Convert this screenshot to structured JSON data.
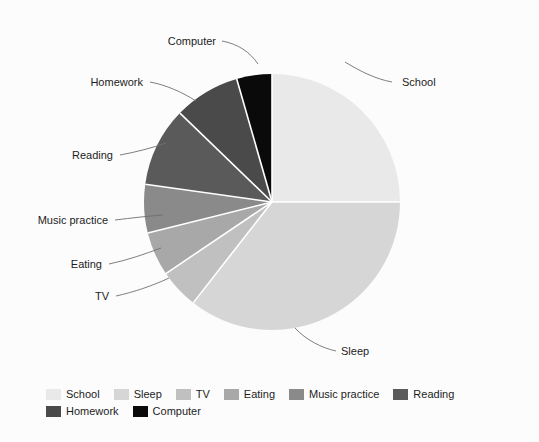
{
  "chart_data": {
    "type": "pie",
    "title": "",
    "legend_position": "bottom",
    "categories": [
      "School",
      "Sleep",
      "TV",
      "Eating",
      "Music practice",
      "Reading",
      "Homework",
      "Computer"
    ],
    "values": [
      90,
      128,
      18,
      20,
      22,
      36,
      30,
      16
    ],
    "unit": "degrees of arc",
    "slices": [
      {
        "label": "School",
        "color": "#e9e9e9",
        "start_angle": 0,
        "sweep": 90,
        "label_x": 402,
        "label_y": 86,
        "anchor": "start",
        "leader": "M 392 82 C 375 79, 358 70, 345 62"
      },
      {
        "label": "Sleep",
        "color": "#d6d6d6",
        "start_angle": 90,
        "sweep": 128,
        "label_x": 341,
        "label_y": 355,
        "anchor": "start",
        "leader": "M 336 351 C 322 348, 306 340, 295 328"
      },
      {
        "label": "TV",
        "color": "#c0c0c0",
        "start_angle": 218,
        "sweep": 18,
        "label_x": 109,
        "label_y": 300,
        "anchor": "end",
        "leader": "M 116 296 C 134 292, 152 286, 169 278"
      },
      {
        "label": "Eating",
        "color": "#a8a8a8",
        "start_angle": 236,
        "sweep": 20,
        "label_x": 102,
        "label_y": 268,
        "anchor": "end",
        "leader": "M 109 264 C 128 260, 145 254, 161 248"
      },
      {
        "label": "Music practice",
        "color": "#8a8a8a",
        "start_angle": 256,
        "sweep": 22,
        "label_x": 108,
        "label_y": 224,
        "anchor": "end",
        "leader": "M 115 220 C 132 218, 148 216, 163 215"
      },
      {
        "label": "Reading",
        "color": "#5a5a5a",
        "start_angle": 278,
        "sweep": 36,
        "label_x": 113,
        "label_y": 159,
        "anchor": "end",
        "leader": "M 120 155 C 136 152, 152 148, 166 143"
      },
      {
        "label": "Homework",
        "color": "#4a4a4a",
        "start_angle": 314,
        "sweep": 30,
        "label_x": 143,
        "label_y": 86,
        "anchor": "end",
        "leader": "M 150 82 C 166 85, 182 92, 196 101"
      },
      {
        "label": "Computer",
        "color": "#0a0a0a",
        "start_angle": 344,
        "sweep": 16,
        "label_x": 216,
        "label_y": 45,
        "anchor": "end",
        "leader": "M 222 41 C 238 44, 250 52, 258 64"
      }
    ],
    "geometry": {
      "cx": 272,
      "cy": 202,
      "r": 128
    }
  },
  "legend": {
    "items": [
      {
        "label": "School",
        "color": "#e9e9e9"
      },
      {
        "label": "Sleep",
        "color": "#d6d6d6"
      },
      {
        "label": "TV",
        "color": "#c0c0c0"
      },
      {
        "label": "Eating",
        "color": "#a8a8a8"
      },
      {
        "label": "Music practice",
        "color": "#8a8a8a"
      },
      {
        "label": "Reading",
        "color": "#5a5a5a"
      },
      {
        "label": "Homework",
        "color": "#4a4a4a"
      },
      {
        "label": "Computer",
        "color": "#0a0a0a"
      }
    ]
  }
}
